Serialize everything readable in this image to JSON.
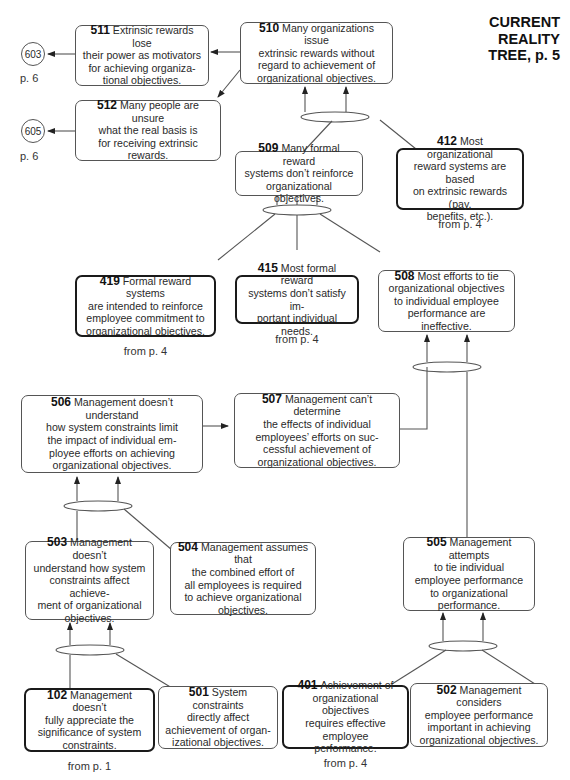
{
  "title": {
    "line1": "CURRENT",
    "line2": "REALITY",
    "line3": "TREE, p. 5"
  },
  "page_refs": [
    {
      "id": "603",
      "label": "p. 6"
    },
    {
      "id": "605",
      "label": "p. 6"
    }
  ],
  "nodes": {
    "n510": {
      "num": "510",
      "text": "Many organizations issue\nextrinsic rewards without\nregard to achievement of\norganizational objectives."
    },
    "n511": {
      "num": "511",
      "text": "Extrinsic rewards lose\ntheir power as motivators\nfor achieving organiza-\ntional objectives."
    },
    "n512": {
      "num": "512",
      "text": "Many people are unsure\nwhat the real basis is\nfor receiving extrinsic\nrewards."
    },
    "n509": {
      "num": "509",
      "text": "Many formal reward\nsystems don’t reinforce\norganizational objectives."
    },
    "n412": {
      "num": "412",
      "text": "Most organizational\nreward systems are based\non extrinsic rewards (pay,\nbenefits, etc.).",
      "source": "from p. 4"
    },
    "n419": {
      "num": "419",
      "text": "Formal reward systems\nare intended to reinforce\nemployee commitment to\norganizational objectives.",
      "source": "from p. 4"
    },
    "n415": {
      "num": "415",
      "text": "Most formal reward\nsystems don’t satisfy im-\nportant individual needs.",
      "source": "from p. 4"
    },
    "n508": {
      "num": "508",
      "text": "Most efforts to tie\norganizational objectives\nto individual employee\nperformance are ineffective."
    },
    "n506": {
      "num": "506",
      "text": "Management doesn’t understand\nhow system constraints limit\nthe impact of individual em-\nployee efforts on achieving\norganizational objectives."
    },
    "n507": {
      "num": "507",
      "text": "Management can’t determine\nthe effects of individual\nemployees’ efforts on suc-\ncessful achievement of\norganizational objectives."
    },
    "n503": {
      "num": "503",
      "text": "Management doesn’t\nunderstand how system\nconstraints affect achieve-\nment of organizational\nobjectives."
    },
    "n504": {
      "num": "504",
      "text": "Management assumes that\nthe combined effort of\nall employees is required\nto achieve organizational\nobjectives."
    },
    "n505": {
      "num": "505",
      "text": "Management attempts\nto tie individual\nemployee performance\nto organizational\nperformance."
    },
    "n102": {
      "num": "102",
      "text": "Management doesn’t\nfully appreciate the\nsignificance of system\nconstraints.",
      "source": "from p. 1"
    },
    "n501": {
      "num": "501",
      "text": "System constraints\ndirectly affect\nachievement of organ-\nizational objectives."
    },
    "n401": {
      "num": "401",
      "text": "Achievement of\norganizational objectives\nrequires effective\nemployee performance.",
      "source": "from p. 4"
    },
    "n502": {
      "num": "502",
      "text": "Management considers\nemployee performance\nimportant in achieving\norganizational objectives."
    }
  },
  "colors": {
    "line": "#555555",
    "thick_border": "#1a1a1a",
    "text": "#2a2a2a"
  }
}
